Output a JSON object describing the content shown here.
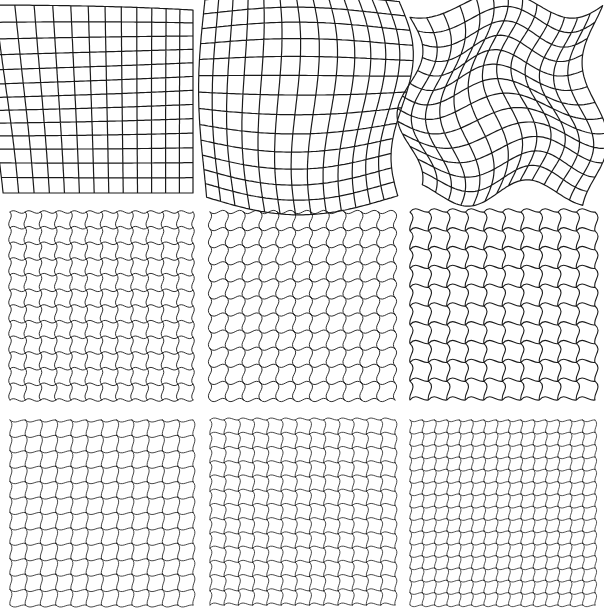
{
  "figure": {
    "background": "#ffffff",
    "line_color": "#1a1a1a",
    "rows": [
      {
        "label": "row-1-smooth-global-warps",
        "panels": [
          {
            "id": "panel-1-1",
            "x": 10,
            "y": 5,
            "w": 183,
            "h": 188,
            "lines": 13,
            "type": "global",
            "mode": "pinch",
            "amp": 0.18,
            "stroke": 1.2
          },
          {
            "id": "panel-1-2",
            "x": 210,
            "y": 5,
            "w": 185,
            "h": 188,
            "lines": 13,
            "type": "global",
            "mode": "bulge",
            "amp": 0.22,
            "stroke": 1.2
          },
          {
            "id": "panel-1-3",
            "x": 410,
            "y": 5,
            "w": 185,
            "h": 188,
            "lines": 13,
            "type": "global",
            "mode": "wave",
            "amp": 0.07,
            "stroke": 1.2
          }
        ]
      },
      {
        "label": "row-2-periodic-curved-tiles",
        "panels": [
          {
            "id": "panel-2-1",
            "x": 10,
            "y": 212,
            "w": 183,
            "h": 188,
            "lines": 12,
            "type": "local",
            "amp": 0.32,
            "phase": 0,
            "stroke": 0.9
          },
          {
            "id": "panel-2-2",
            "x": 210,
            "y": 212,
            "w": 185,
            "h": 188,
            "lines": 11,
            "type": "local",
            "amp": 0.36,
            "phase": 1,
            "stroke": 0.9
          },
          {
            "id": "panel-2-3",
            "x": 410,
            "y": 212,
            "w": 185,
            "h": 188,
            "lines": 10,
            "type": "local",
            "amp": 0.42,
            "phase": 2,
            "stroke": 1.1
          }
        ]
      },
      {
        "label": "row-3-fine-periodic-tiles",
        "panels": [
          {
            "id": "panel-3-1",
            "x": 10,
            "y": 420,
            "w": 183,
            "h": 185,
            "lines": 12,
            "type": "local",
            "amp": 0.34,
            "phase": 3,
            "stroke": 0.8
          },
          {
            "id": "panel-3-2",
            "x": 210,
            "y": 420,
            "w": 185,
            "h": 185,
            "lines": 13,
            "type": "local",
            "amp": 0.36,
            "phase": 4,
            "stroke": 0.8
          },
          {
            "id": "panel-3-3",
            "x": 410,
            "y": 420,
            "w": 185,
            "h": 185,
            "lines": 15,
            "type": "local",
            "amp": 0.36,
            "phase": 5,
            "stroke": 0.75
          }
        ]
      }
    ]
  }
}
